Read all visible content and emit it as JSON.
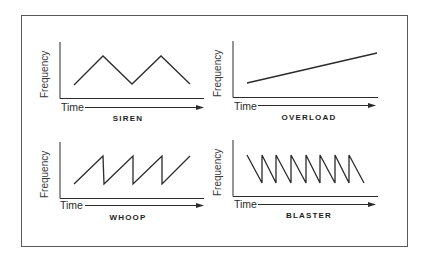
{
  "figure": {
    "panels": [
      {
        "id": "siren",
        "title": "SIREN",
        "xlabel": "Time",
        "ylabel": "Frequency",
        "shape": "triangle wave",
        "points": [
          [
            74,
            85
          ],
          [
            103,
            56
          ],
          [
            132,
            84
          ],
          [
            161,
            56
          ],
          [
            190,
            84
          ]
        ]
      },
      {
        "id": "overload",
        "title": "OVERLOAD",
        "xlabel": "Time",
        "ylabel": "Frequency",
        "shape": "rising ramp",
        "points": [
          [
            247,
            83
          ],
          [
            377,
            53
          ]
        ]
      },
      {
        "id": "whoop",
        "title": "WHOOP",
        "xlabel": "Time",
        "ylabel": "Frequency",
        "shape": "rising sawtooth",
        "points": [
          [
            74,
            184
          ],
          [
            103,
            156
          ],
          [
            104,
            184
          ],
          [
            133,
            156
          ],
          [
            133,
            184
          ],
          [
            162,
            156
          ],
          [
            162,
            184
          ],
          [
            190,
            156
          ]
        ]
      },
      {
        "id": "blaster",
        "title": "BLASTER",
        "xlabel": "Time",
        "ylabel": "Frequency",
        "shape": "falling sawtooth",
        "points": [
          [
            247,
            155
          ],
          [
            262,
            183
          ],
          [
            262,
            155
          ],
          [
            276,
            183
          ],
          [
            276,
            155
          ],
          [
            291,
            183
          ],
          [
            291,
            155
          ],
          [
            306,
            183
          ],
          [
            306,
            155
          ],
          [
            320,
            183
          ],
          [
            320,
            155
          ],
          [
            335,
            183
          ],
          [
            335,
            155
          ],
          [
            349,
            183
          ],
          [
            349,
            155
          ],
          [
            364,
            183
          ]
        ]
      }
    ]
  },
  "colors": {
    "line": "#2b2b2b",
    "frame": "#5a5a5a",
    "background": "#ffffff"
  }
}
